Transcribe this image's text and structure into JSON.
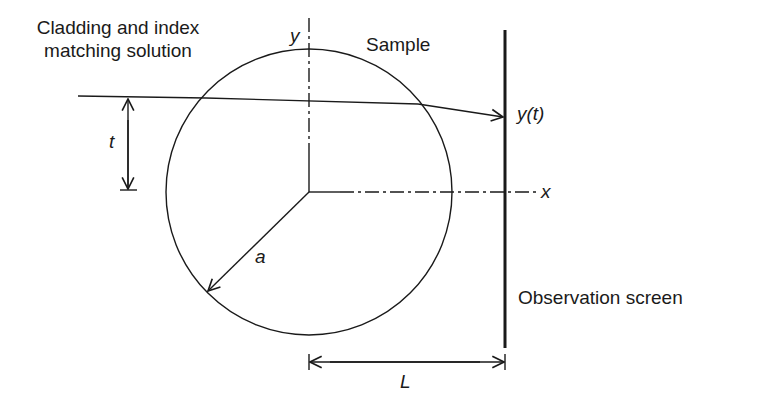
{
  "labels": {
    "cladding_line1": "Cladding and index",
    "cladding_line2": "matching solution",
    "sample": "Sample",
    "y_axis": "y",
    "x_axis": "x",
    "y_of_t": "y(t)",
    "t": "t",
    "a": "a",
    "L": "L",
    "observation_screen": "Observation screen"
  },
  "colors": {
    "stroke": "#1a1a1a",
    "background": "#ffffff"
  },
  "geometry": {
    "circle_center": [
      309,
      192
    ],
    "circle_radius": 143,
    "screen_x": 505
  }
}
